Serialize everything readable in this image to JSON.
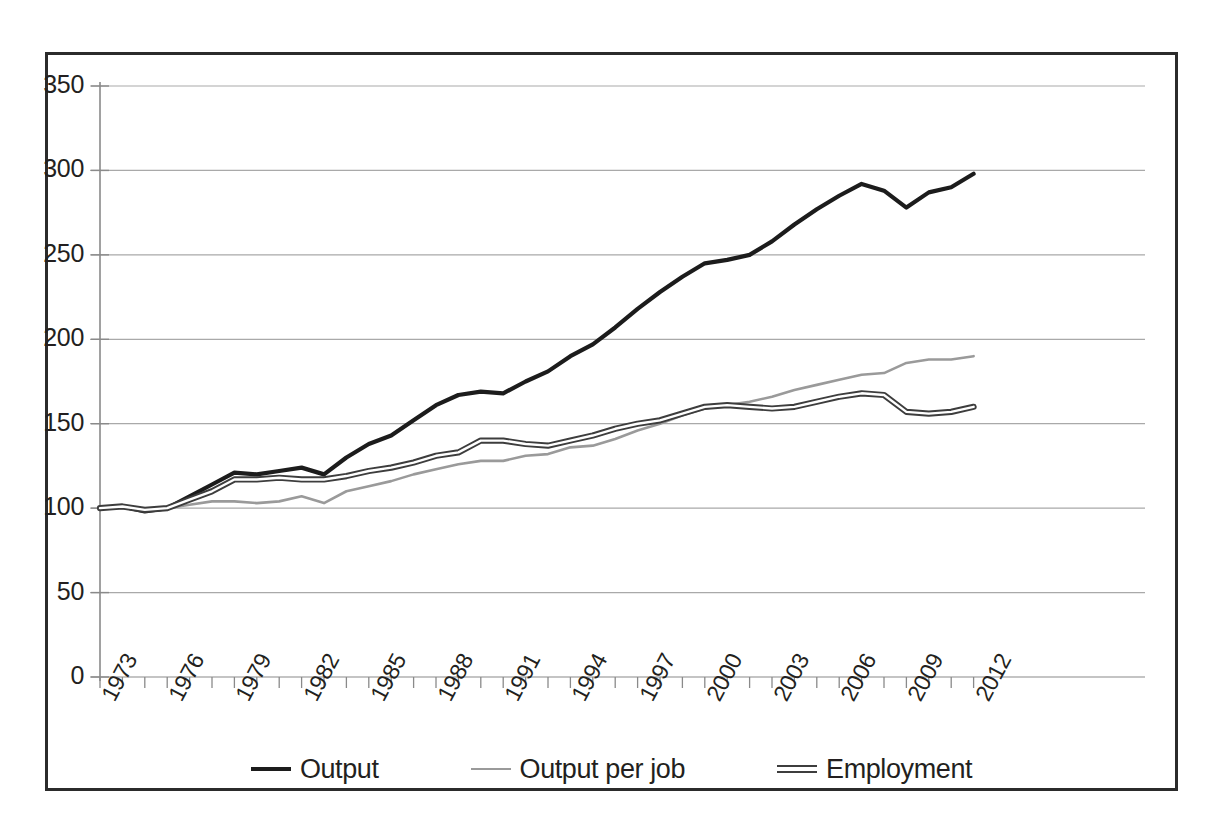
{
  "chart_data": {
    "type": "line",
    "title": "",
    "subtitle": "",
    "xlabel": "",
    "ylabel": "",
    "ylim": [
      0,
      350
    ],
    "yticks": [
      0,
      50,
      100,
      150,
      200,
      250,
      300,
      350
    ],
    "grid": true,
    "legend_position": "bottom",
    "x": [
      1973,
      1974,
      1975,
      1976,
      1977,
      1978,
      1979,
      1980,
      1981,
      1982,
      1983,
      1984,
      1985,
      1986,
      1987,
      1988,
      1989,
      1990,
      1991,
      1992,
      1993,
      1994,
      1995,
      1996,
      1997,
      1998,
      1999,
      2000,
      2001,
      2002,
      2003,
      2004,
      2005,
      2006,
      2007,
      2008,
      2009,
      2010,
      2011,
      2012
    ],
    "xtick_labels": [
      "1973",
      "1976",
      "1979",
      "1982",
      "1985",
      "1988",
      "1991",
      "1994",
      "1997",
      "2000",
      "2003",
      "2006",
      "2009",
      "2012"
    ],
    "xtick_values": [
      1973,
      1976,
      1979,
      1982,
      1985,
      1988,
      1991,
      1994,
      1997,
      2000,
      2003,
      2006,
      2009,
      2012
    ],
    "series": [
      {
        "name": "Output",
        "color": "#1c1c1c",
        "width": 4.2,
        "style": "solid",
        "values": [
          100,
          101,
          98,
          100,
          107,
          114,
          121,
          120,
          122,
          124,
          120,
          130,
          138,
          143,
          152,
          161,
          167,
          169,
          168,
          175,
          181,
          190,
          197,
          207,
          218,
          228,
          237,
          245,
          247,
          250,
          258,
          268,
          277,
          285,
          292,
          288,
          278,
          287,
          290,
          298
        ]
      },
      {
        "name": "Output per job",
        "color": "#9a9a9a",
        "width": 2.6,
        "style": "solid",
        "values": [
          100,
          100,
          99,
          100,
          102,
          104,
          104,
          103,
          104,
          107,
          103,
          110,
          113,
          116,
          120,
          123,
          126,
          128,
          128,
          131,
          132,
          136,
          137,
          141,
          146,
          150,
          155,
          159,
          161,
          163,
          166,
          170,
          173,
          176,
          179,
          180,
          186,
          188,
          188,
          190
        ]
      },
      {
        "name": "Employment",
        "color": "#3d3d3d",
        "width": 3.0,
        "style": "double",
        "values": [
          100,
          101,
          99,
          100,
          105,
          110,
          117,
          117,
          118,
          117,
          117,
          119,
          122,
          124,
          127,
          131,
          133,
          140,
          140,
          138,
          137,
          140,
          143,
          147,
          150,
          152,
          156,
          160,
          161,
          160,
          159,
          160,
          163,
          166,
          168,
          167,
          157,
          156,
          157,
          160
        ]
      }
    ]
  },
  "legend": {
    "entries": [
      {
        "label": "Output",
        "marker": "line-solid-dark-icon"
      },
      {
        "label": "Output per job",
        "marker": "line-solid-gray-icon"
      },
      {
        "label": "Employment",
        "marker": "line-double-icon"
      }
    ]
  }
}
